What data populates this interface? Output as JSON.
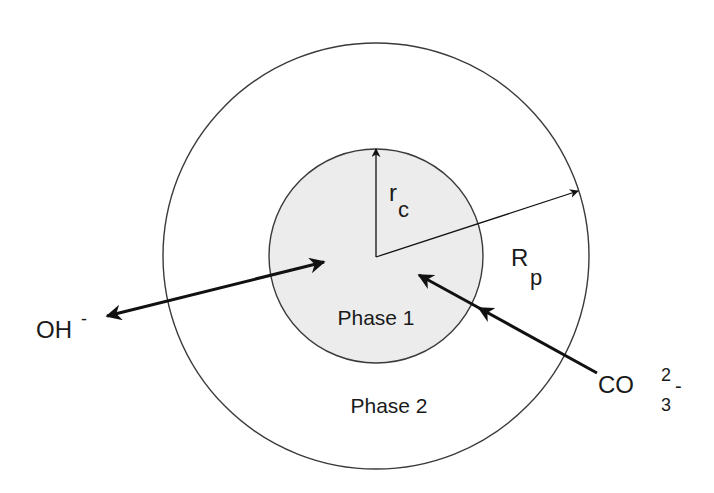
{
  "diagram": {
    "type": "shrinking-core particle schematic",
    "colors": {
      "background": "#ffffff",
      "core_fill": "#ececec",
      "stroke": "#3a3a3a",
      "arrow": "#111111",
      "text": "#1a1a1a"
    },
    "outer_circle": {
      "cx": 376,
      "cy": 256,
      "r": 213,
      "label": "Phase 2"
    },
    "inner_circle": {
      "cx": 376,
      "cy": 256,
      "r": 107,
      "label": "Phase 1"
    },
    "radius_labels": {
      "core": {
        "main": "r",
        "sub": "c"
      },
      "particle": {
        "main": "R",
        "sub": "p"
      }
    },
    "species": {
      "hydroxide": {
        "main": "OH",
        "sup": "-",
        "direction": "outward"
      },
      "carbonate": {
        "main": "CO",
        "sub": "3",
        "sup": "2",
        "charge": "-",
        "direction": "inward"
      }
    }
  }
}
